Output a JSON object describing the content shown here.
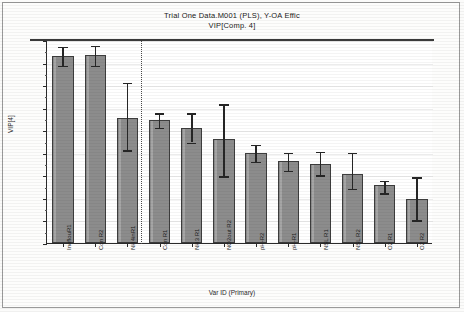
{
  "chart_data": {
    "type": "bar",
    "title": "Trial One Data.M001 (PLS), Y-OA Effic",
    "subtitle": "VIP[Comp. 4]",
    "xlabel": "Var ID (Primary)",
    "ylabel": "VIP[4]",
    "ylim": [
      0.0,
      1.8
    ],
    "ytick_labels": [
      "0.00",
      "0.20",
      "0.40",
      "0.60",
      "0.80",
      "1.00",
      "1.20",
      "1.40",
      "1.60",
      "1.80"
    ],
    "ytick_values": [
      0.0,
      0.2,
      0.4,
      0.6,
      0.8,
      1.0,
      1.2,
      1.4,
      1.6,
      1.8
    ],
    "grid": true,
    "legend": "none",
    "reference_line": {
      "after_category": "NH4inR1",
      "style": "dotted",
      "orientation": "vertical"
    },
    "categories": [
      "InoflouR1",
      "Con R2",
      "NH4inR1",
      "Con R1",
      "NH3 R1",
      "NO2out R2",
      "pH-R2",
      "pH-R1",
      "NSL R1",
      "NSL R2",
      "O2 R1",
      "O2 R2"
    ],
    "values": [
      1.66,
      1.67,
      1.11,
      1.09,
      1.02,
      0.92,
      0.8,
      0.73,
      0.7,
      0.61,
      0.51,
      0.39
    ],
    "error_upper": [
      1.75,
      1.76,
      1.43,
      1.16,
      1.16,
      1.24,
      0.88,
      0.81,
      0.82,
      0.81,
      0.56,
      0.59
    ],
    "error_lower": [
      1.58,
      1.58,
      0.83,
      1.03,
      0.9,
      0.6,
      0.73,
      0.65,
      0.61,
      0.49,
      0.45,
      0.21
    ],
    "bar_color": "#8c8c8c",
    "bar_edge_color": "#3d3d3d",
    "error_color": "#262626"
  }
}
